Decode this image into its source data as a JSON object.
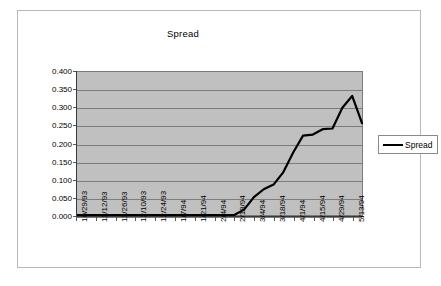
{
  "chart_data": {
    "type": "line",
    "title": "Spread",
    "xlabel": "",
    "ylabel": "",
    "grid": true,
    "legend_position": "right",
    "ylim": [
      0.0,
      0.4
    ],
    "ytick_labels": [
      "0.400",
      "0.350",
      "0.300",
      "0.250",
      "0.200",
      "0.150",
      "0.100",
      "0.050",
      "0.000"
    ],
    "ytick_values": [
      0.4,
      0.35,
      0.3,
      0.25,
      0.2,
      0.15,
      0.1,
      0.05,
      0.0
    ],
    "categories": [
      "10/29/93",
      "11/5/93",
      "11/12/93",
      "11/19/93",
      "11/26/93",
      "12/3/93",
      "12/10/93",
      "12/17/93",
      "12/24/93",
      "12/31/93",
      "1/7/94",
      "1/14/94",
      "1/21/94",
      "1/28/94",
      "2/4/94",
      "2/11/94",
      "2/18/94",
      "2/25/94",
      "3/4/94",
      "3/11/94",
      "3/18/94",
      "3/25/94",
      "4/1/94",
      "4/8/94",
      "4/15/94",
      "4/22/94",
      "4/29/94",
      "5/6/94",
      "5/13/94",
      "5/20/94"
    ],
    "xtick_labels": [
      "10/29/93",
      "11/12/93",
      "11/26/93",
      "12/10/93",
      "12/24/93",
      "1/7/94",
      "1/21/94",
      "2/4/94",
      "2/18/94",
      "3/4/94",
      "3/18/94",
      "4/1/94",
      "4/15/94",
      "4/29/94",
      "5/13/94"
    ],
    "series": [
      {
        "name": "Spread",
        "color": "#000000",
        "values": [
          0.0,
          0.0,
          0.0,
          0.0,
          0.0,
          0.0,
          0.0,
          0.0,
          0.0,
          0.0,
          0.0,
          0.0,
          0.0,
          0.0,
          0.0,
          0.0,
          0.0,
          0.015,
          0.05,
          0.072,
          0.085,
          0.12,
          0.175,
          0.222,
          0.225,
          0.24,
          0.242,
          0.3,
          0.333,
          0.257
        ]
      }
    ]
  },
  "legend": {
    "entries": [
      {
        "label": "Spread"
      }
    ]
  }
}
